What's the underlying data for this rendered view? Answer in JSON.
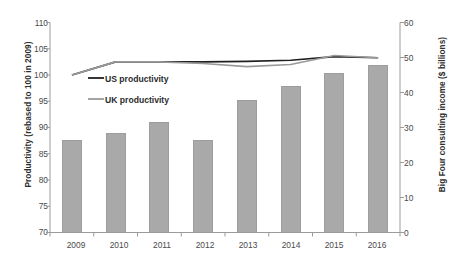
{
  "chart_data": {
    "type": "bar",
    "title": "",
    "subtitle": "",
    "categories": [
      "2009",
      "2010",
      "2011",
      "2012",
      "2013",
      "2014",
      "2015",
      "2016"
    ],
    "xlabel": "",
    "ylabel": "Productivity (rebased to 100 in 2009)",
    "ylabel_secondary": "Big Four consulting income ($ billions)",
    "ylim": [
      70,
      110
    ],
    "ylim_secondary": [
      0,
      60
    ],
    "yticks": [
      70,
      75,
      80,
      85,
      90,
      95,
      100,
      105,
      110
    ],
    "yticks_secondary": [
      0,
      10,
      20,
      30,
      40,
      50,
      60
    ],
    "grid": false,
    "legend_position": "upper-left-inside",
    "series": [
      {
        "name": "Big Four consulting income ($ billions)",
        "type": "bar",
        "axis": "right",
        "color": "#a9a9a9",
        "values": [
          26.5,
          28.5,
          31.5,
          26.5,
          38.0,
          42.0,
          45.5,
          48.0
        ],
        "in_legend": false
      },
      {
        "name": "US productivity",
        "type": "line",
        "axis": "left",
        "color": "#231f20",
        "values": [
          100.0,
          102.5,
          102.5,
          102.5,
          102.6,
          102.8,
          103.5,
          103.3
        ],
        "in_legend": true
      },
      {
        "name": "UK productivity",
        "type": "line",
        "axis": "left",
        "color": "#9a9a9a",
        "values": [
          100.0,
          102.5,
          102.5,
          102.2,
          101.6,
          102.0,
          103.7,
          103.3
        ],
        "in_legend": true
      }
    ],
    "legend": [
      {
        "label": "US productivity",
        "color": "#231f20"
      },
      {
        "label": "UK productivity",
        "color": "#9a9a9a"
      }
    ],
    "annotations": []
  }
}
